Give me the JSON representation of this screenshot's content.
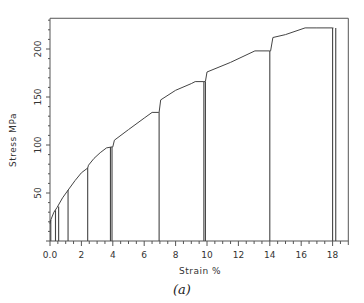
{
  "chart_data": {
    "type": "line",
    "title": "",
    "caption": "(a)",
    "xlabel": "Strain",
    "xunit": "%",
    "ylabel": "Stress",
    "yunit": "MPa",
    "xlim": [
      0,
      19
    ],
    "ylim": [
      0,
      232
    ],
    "x_ticks": [
      0,
      2,
      4,
      6,
      8,
      10,
      12,
      14,
      16,
      18
    ],
    "x_tick_labels": [
      "0.0",
      "2",
      "4",
      "6",
      "8",
      "10",
      "12",
      "14",
      "16",
      "18"
    ],
    "x_minor_step": 0.5,
    "y_ticks": [
      50,
      100,
      150,
      200
    ],
    "y_tick_labels": [
      "50",
      "100",
      "150",
      "200"
    ],
    "y_minor_step": 10,
    "grid": false,
    "legend": null,
    "series": [
      {
        "name": "Stress-strain curve (loading envelope)",
        "x": [
          0.0,
          0.05,
          0.25,
          0.45,
          0.8,
          1.15,
          1.6,
          2.0,
          2.4,
          2.45,
          2.8,
          3.2,
          3.6,
          3.95,
          4.0,
          4.1,
          5.0,
          6.0,
          6.5,
          6.9,
          6.95,
          7.05,
          8.0,
          9.0,
          9.25,
          9.8,
          9.9,
          10.0,
          11.5,
          13.05,
          14.0,
          14.05,
          14.2,
          15.0,
          16.25,
          17.0,
          18.0,
          18.05
        ],
        "y": [
          18,
          22,
          30,
          35,
          45,
          53,
          63,
          71,
          76,
          79,
          86,
          92,
          97,
          98,
          98,
          105,
          116,
          128,
          134,
          134,
          134,
          147,
          157,
          164,
          166,
          166,
          166,
          176,
          186,
          198,
          198,
          198,
          212,
          215,
          222,
          222,
          222,
          222
        ]
      },
      {
        "name": "Unloading lines",
        "segments": [
          {
            "x": 0.05,
            "y_top": 22,
            "y_bottom": 0
          },
          {
            "x": 0.35,
            "y_top": 32,
            "y_bottom": 0
          },
          {
            "x": 0.55,
            "y_top": 36,
            "y_bottom": 0
          },
          {
            "x": 1.15,
            "y_top": 53,
            "y_bottom": 0
          },
          {
            "x": 2.4,
            "y_top": 76,
            "y_bottom": 0
          },
          {
            "x": 3.85,
            "y_top": 98,
            "y_bottom": 0
          },
          {
            "x": 3.95,
            "y_top": 98,
            "y_bottom": 0
          },
          {
            "x": 6.95,
            "y_top": 134,
            "y_bottom": 0
          },
          {
            "x": 9.8,
            "y_top": 166,
            "y_bottom": 0
          },
          {
            "x": 9.9,
            "y_top": 166,
            "y_bottom": 0
          },
          {
            "x": 14.0,
            "y_top": 198,
            "y_bottom": 0
          },
          {
            "x": 18.0,
            "y_top": 222,
            "y_bottom": 0
          },
          {
            "x": 18.2,
            "y_top": 222,
            "y_bottom": 0
          }
        ]
      }
    ]
  },
  "labels": {
    "ylabel_full": "Stress   MPa",
    "xlabel_full": "Strain   %",
    "caption": "(a)"
  },
  "colors": {
    "line": "#444444",
    "axis": "#555555",
    "background": "#ffffff"
  }
}
